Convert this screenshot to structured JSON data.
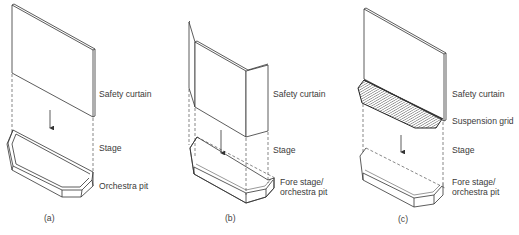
{
  "figure": {
    "panels": [
      {
        "id": "a",
        "sublabel": "(a)",
        "labels": {
          "curtain": "Safety curtain",
          "stage": "Stage",
          "pit": "Orchestra pit"
        }
      },
      {
        "id": "b",
        "sublabel": "(b)",
        "labels": {
          "curtain": "Safety curtain",
          "stage": "Stage",
          "pit_line1": "Fore stage/",
          "pit_line2": "orchestra pit"
        }
      },
      {
        "id": "c",
        "sublabel": "(c)",
        "labels": {
          "curtain": "Safety curtain",
          "grid": "Suspension grid",
          "stage": "Stage",
          "pit_line1": "Fore stage/",
          "pit_line2": "orchestra pit"
        }
      }
    ],
    "colors": {
      "line": "#333333",
      "dash": "#555555",
      "hatch": "#444444",
      "background": "#ffffff"
    }
  }
}
